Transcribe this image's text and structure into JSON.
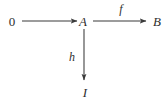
{
  "diagram": {
    "kind": "commutative-diagram",
    "background_color": "#ffffff",
    "stroke_color": "#3a3a3a",
    "text_color": "#2e2e2e",
    "nodes": [
      {
        "id": "zero",
        "label": "0",
        "style": "upright",
        "x": 12,
        "y": 21
      },
      {
        "id": "A",
        "label": "A",
        "style": "italic",
        "x": 83,
        "y": 21
      },
      {
        "id": "B",
        "label": "B",
        "style": "italic",
        "x": 157,
        "y": 21
      },
      {
        "id": "I",
        "label": "I",
        "style": "italic",
        "x": 85,
        "y": 92
      }
    ],
    "edges": [
      {
        "id": "zero-to-A",
        "from": "zero",
        "to": "A",
        "label": "",
        "direction": "right",
        "x1": 22,
        "y1": 21,
        "x2": 77,
        "y2": 21
      },
      {
        "id": "A-to-B",
        "from": "A",
        "to": "B",
        "label": "f",
        "label_x": 121,
        "label_y": 9,
        "direction": "right",
        "x1": 93,
        "y1": 21,
        "x2": 146,
        "y2": 21
      },
      {
        "id": "A-to-I",
        "from": "A",
        "to": "I",
        "label": "h",
        "label_x": 72,
        "label_y": 57,
        "direction": "down",
        "x1": 84,
        "y1": 29,
        "x2": 84,
        "y2": 80
      }
    ]
  }
}
